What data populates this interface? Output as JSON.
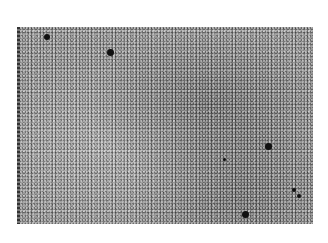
{
  "image": {
    "description": "Grainy grayscale speckled texture with scattered dark dots",
    "region": {
      "x": 17,
      "y": 27,
      "width": 296,
      "height": 197
    },
    "colors": {
      "background": "#ffffff",
      "base": "#9a9a9a",
      "dot": "#111111"
    },
    "dots": [
      {
        "x": 47,
        "y": 37,
        "r": 3
      },
      {
        "x": 110,
        "y": 52,
        "r": 3.5
      },
      {
        "x": 268,
        "y": 146,
        "r": 3.5
      },
      {
        "x": 245,
        "y": 214,
        "r": 3.5
      },
      {
        "x": 224,
        "y": 159,
        "r": 1.5
      },
      {
        "x": 294,
        "y": 190,
        "r": 2
      },
      {
        "x": 299,
        "y": 196,
        "r": 2
      }
    ]
  }
}
